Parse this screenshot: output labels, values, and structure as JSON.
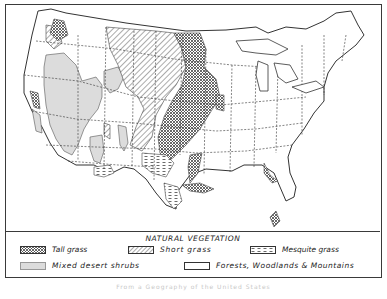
{
  "map": {
    "title": "NATURAL VEGETATION",
    "region": "United States",
    "colors": {
      "border": "#3a3a3a",
      "desert_fill": "#dcdcdc",
      "pattern_ink": "#444444",
      "background": "#ffffff"
    }
  },
  "legend": {
    "title": "NATURAL VEGETATION",
    "items": [
      {
        "key": "tall-grass",
        "label": "Tall grass",
        "pattern": "crosshatch"
      },
      {
        "key": "short-grass",
        "label": "Short grass",
        "pattern": "diagonal-lines"
      },
      {
        "key": "mesquite-grass",
        "label": "Mesquite grass",
        "pattern": "dashed-horizontal"
      },
      {
        "key": "mixed-desert-shrubs",
        "label": "Mixed desert shrubs",
        "pattern": "light-gray-fill"
      },
      {
        "key": "forests-woodlands-mountains",
        "label": "Forests, Woodlands & Mountains",
        "pattern": "blank-white"
      }
    ]
  },
  "caption": {
    "text": "From a Geography of the United States"
  }
}
